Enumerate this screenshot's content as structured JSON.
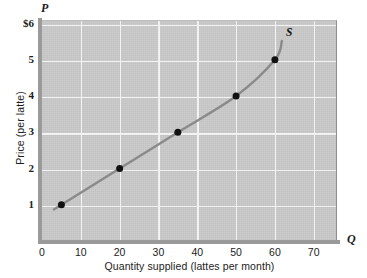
{
  "chart_data": {
    "type": "line",
    "title": "",
    "subtitle": "",
    "xlabel": "Quantity supplied (lattes per month)",
    "ylabel": "Price (per latte)",
    "x_axis_symbol": "Q",
    "y_axis_symbol": "P",
    "xlim": [
      0,
      76
    ],
    "ylim": [
      0,
      6.1
    ],
    "grid": true,
    "legend_position": "inline-right",
    "series": [
      {
        "name": "S",
        "label": "S",
        "label_text": "S",
        "points": [
          {
            "x": 5,
            "y": 1
          },
          {
            "x": 20,
            "y": 2
          },
          {
            "x": 35,
            "y": 3
          },
          {
            "x": 50,
            "y": 4
          },
          {
            "x": 60,
            "y": 5
          }
        ],
        "x": [
          5,
          20,
          35,
          50,
          60
        ],
        "values": [
          1,
          2,
          3,
          4,
          5
        ],
        "marker": "filled-circle",
        "curve_color": "#8a8a8a",
        "marker_color": "#111111"
      }
    ],
    "xticks": [
      {
        "value": 0,
        "label": "0"
      },
      {
        "value": 10,
        "label": "10"
      },
      {
        "value": 20,
        "label": "20"
      },
      {
        "value": 30,
        "label": "30"
      },
      {
        "value": 40,
        "label": "40"
      },
      {
        "value": 50,
        "label": "50"
      },
      {
        "value": 60,
        "label": "60"
      },
      {
        "value": 70,
        "label": "70"
      }
    ],
    "yticks": [
      {
        "value": 1,
        "label": "1"
      },
      {
        "value": 2,
        "label": "2"
      },
      {
        "value": 3,
        "label": "3"
      },
      {
        "value": 4,
        "label": "4"
      },
      {
        "value": 5,
        "label": "5"
      },
      {
        "value": 6,
        "label": "$6"
      }
    ],
    "colors": {
      "plot_background": "#c9c9c9",
      "gridline": "#f2f2f2",
      "axis": "#9a9a9a",
      "curve": "#8a8a8a",
      "marker": "#111111",
      "text": "#1c1c1c",
      "page_background": "#ffffff"
    }
  }
}
